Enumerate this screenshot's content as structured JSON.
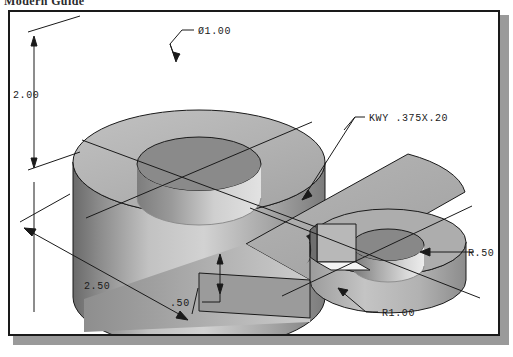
{
  "header": {
    "title": "Modern Guide"
  },
  "drawing": {
    "type": "isometric-cad-solid-model",
    "description": "Shaded isometric view of a two-hole link / bearing block: a tall cylindrical boss with a through hole joined by a flat plate to a shorter cylindrical boss with a keyed through hole.",
    "dimensions": [
      {
        "id": "bore-diameter",
        "label": "Ø1.00",
        "kind": "diameter",
        "value": 1.0,
        "feature": "large top bore",
        "leader": "from label down-left to top bore edge"
      },
      {
        "id": "boss-height",
        "label": "2.00",
        "kind": "linear-vertical",
        "value": 2.0,
        "feature": "overall height of tall cylindrical boss",
        "leader": "vertical dimension line at left with arrows both ends"
      },
      {
        "id": "keyway",
        "label": "KWY .375X.20",
        "kind": "note",
        "width": 0.375,
        "depth": 0.2,
        "feature": "keyway cut in small bore",
        "leader": "from label down-left to keyway notch"
      },
      {
        "id": "small-bore-radius",
        "label": "R.50",
        "kind": "radius",
        "value": 0.5,
        "feature": "small bore radius",
        "leader": "horizontal leader from right to bore wall"
      },
      {
        "id": "boss-outer-radius",
        "label": "R1.00",
        "kind": "radius",
        "value": 1.0,
        "feature": "outer radius of small boss end",
        "leader": "from label up-left to outer edge"
      },
      {
        "id": "center-distance",
        "label": "2.50",
        "kind": "linear-iso",
        "value": 2.5,
        "feature": "distance between hole centers along base",
        "leader": "isometric dimension line along bottom-left with arrows"
      },
      {
        "id": "plate-thickness",
        "label": ".50",
        "kind": "linear-vertical",
        "value": 0.5,
        "feature": "thickness of connecting plate",
        "leader": "short vertical dimension with arrows and jogged leader"
      }
    ],
    "colors": {
      "line": "#1a1a1a",
      "frame_border": "#1a1a1a",
      "page_background": "#ffffff",
      "shadow": "#9a9a9a",
      "top_face": "#b4b4b4",
      "front_face_light": "#c9c9c9",
      "front_face_dark": "#737373",
      "bore_inner": "#8f8f8f",
      "bore_highlight": "#dcdcdc",
      "plate_top": "#a8a8a8",
      "plate_side_dark": "#6e6e6e"
    }
  }
}
